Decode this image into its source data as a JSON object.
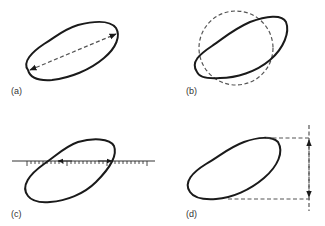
{
  "figure": {
    "panels": [
      {
        "id": "a",
        "label": "(a)",
        "measure": "longest dimension (dashed double arrow across particle)"
      },
      {
        "id": "b",
        "label": "(b)",
        "measure": "equivalent circle overlay (dashed circle)"
      },
      {
        "id": "c",
        "label": "(c)",
        "measure": "graduated ruler line with inward arrows at outline intersections"
      },
      {
        "id": "d",
        "label": "(d)",
        "measure": "distance between parallel tangents (dashed lines with vertical double arrow)"
      }
    ],
    "colors": {
      "outline": "#1a1a1a",
      "dashed": "#555555",
      "label": "#333333",
      "background": "#ffffff"
    }
  }
}
